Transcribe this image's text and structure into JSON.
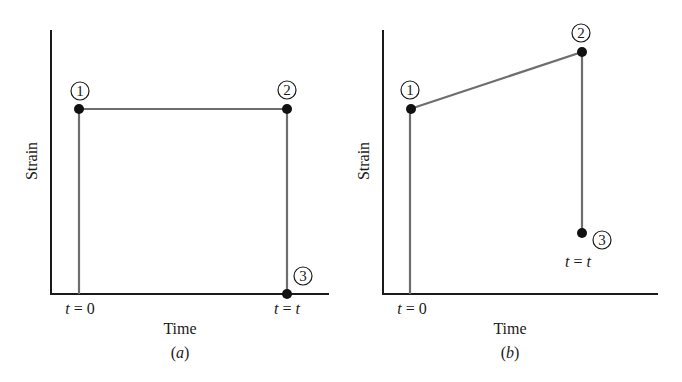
{
  "panels": [
    {
      "id": "a",
      "caption": "(a)",
      "caption_letter": "a",
      "xlabel": "Time",
      "ylabel": "Strain",
      "tick_start": "t = 0",
      "tick_end": "t = t",
      "points": [
        {
          "label": "1",
          "description": "initial strain at t = 0"
        },
        {
          "label": "2",
          "description": "constant strain held until t = t"
        },
        {
          "label": "3",
          "description": "strain returns to zero at t = t"
        }
      ]
    },
    {
      "id": "b",
      "caption": "(b)",
      "caption_letter": "b",
      "xlabel": "Time",
      "ylabel": "Strain",
      "tick_start": "t = 0",
      "tick_end": "t = t",
      "points": [
        {
          "label": "1",
          "description": "initial strain at t = 0"
        },
        {
          "label": "2",
          "description": "strain increases (creep) until t = t"
        },
        {
          "label": "3",
          "description": "partial recovery at t = t, residual strain remains"
        }
      ]
    }
  ],
  "colors": {
    "axis": "#1a1a1a",
    "path": "#6e6e6e",
    "point": "#111111",
    "background": "#ffffff"
  }
}
